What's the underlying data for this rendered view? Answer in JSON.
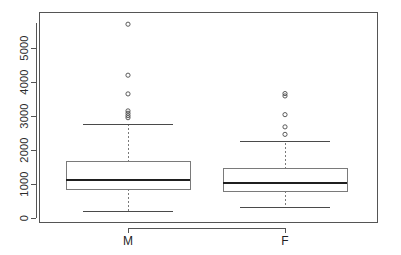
{
  "chart_data": {
    "type": "box",
    "title": "",
    "subtitle": "",
    "xlabel": "",
    "ylabel": "",
    "grid": false,
    "legend": "none",
    "frame": true,
    "categories": [
      "M",
      "F"
    ],
    "xtick_labels": [
      "M",
      "F"
    ],
    "ytick_labels": [
      "0",
      "1000",
      "2000",
      "3000",
      "4000",
      "5000"
    ],
    "yticks": [
      0,
      1000,
      2000,
      3000,
      4000,
      5000
    ],
    "ylim": [
      -120,
      6050
    ],
    "y_axis_rotated_labels": true,
    "boxes": [
      {
        "name": "M",
        "whisker_low": 200,
        "q1": 840,
        "median": 1120,
        "q3": 1650,
        "whisker_high": 2740,
        "outliers": [
          5700,
          4200,
          3650,
          3150,
          3080,
          3010,
          2950
        ]
      },
      {
        "name": "F",
        "whisker_low": 300,
        "q1": 790,
        "median": 1030,
        "q3": 1450,
        "whisker_high": 2250,
        "outliers": [
          3660,
          3590,
          3040,
          2680,
          2460
        ]
      }
    ],
    "colors": {
      "box_stroke": "#7a7a7a",
      "median_stroke": "#1f1f1f",
      "whisker_stroke": "#7a7a7a",
      "outlier_stroke": "#4a4a4a",
      "axis": "#555555",
      "background": "#ffffff"
    }
  }
}
